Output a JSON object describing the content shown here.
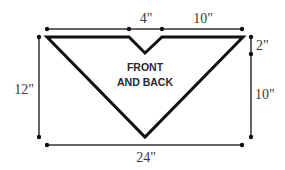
{
  "diagram": {
    "shape_label_line1": "FRONT",
    "shape_label_line2": "AND BACK",
    "dimensions": {
      "top_center": "4\"",
      "top_right": "10\"",
      "right_top": "2\"",
      "right_bottom": "10\"",
      "left": "12\"",
      "bottom": "24\""
    },
    "colors": {
      "shape_stroke": "#111111",
      "dimension_line": "#333333",
      "background": "#ffffff"
    }
  }
}
